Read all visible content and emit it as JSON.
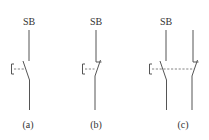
{
  "diagram": {
    "type": "pushbutton-switch-symbols",
    "colors": {
      "line": "#555555",
      "text": "#333333",
      "background": "#ffffff"
    },
    "panels": [
      {
        "id": "a",
        "device_label": "SB",
        "caption": "(a)",
        "contact": "normally-open"
      },
      {
        "id": "b",
        "device_label": "SB",
        "caption": "(b)",
        "contact": "normally-closed"
      },
      {
        "id": "c",
        "device_label": "SB",
        "caption": "(c)",
        "contact": "compound (NO + NC)"
      }
    ]
  }
}
